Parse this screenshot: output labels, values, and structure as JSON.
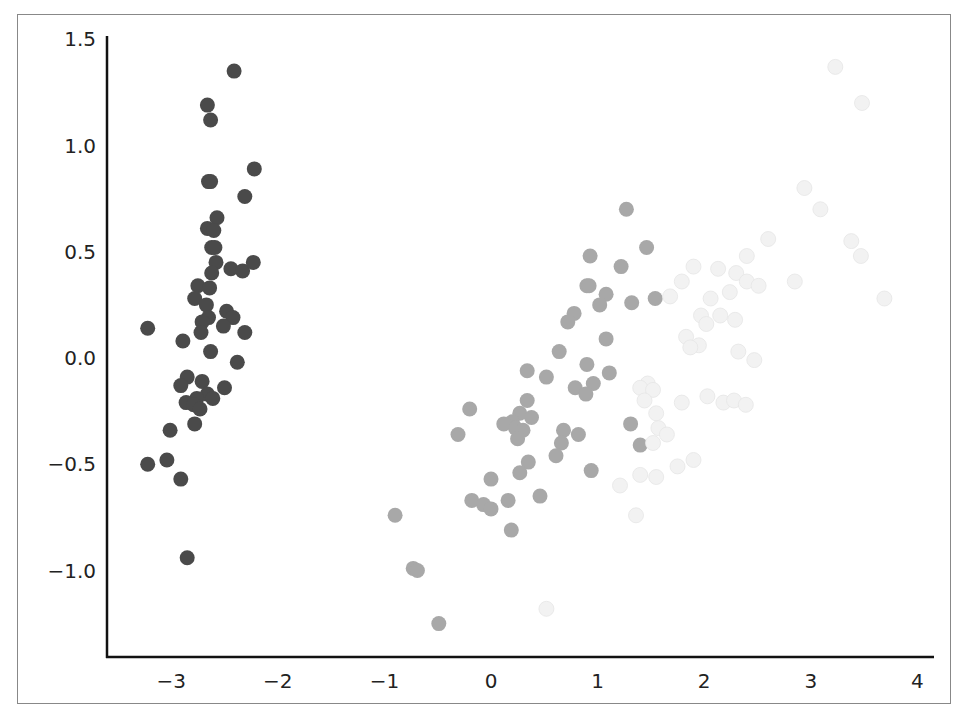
{
  "chart_data": {
    "type": "scatter",
    "title": "",
    "xlabel": "",
    "ylabel": "",
    "xlim": [
      -3.6,
      4.15
    ],
    "ylim": [
      -1.4,
      1.5
    ],
    "grid": false,
    "legend": null,
    "x_ticks": [
      "−3",
      "−2",
      "−1",
      "0",
      "1",
      "2",
      "3",
      "4"
    ],
    "x_tick_values": [
      -3,
      -2,
      -1,
      0,
      1,
      2,
      3,
      4
    ],
    "y_ticks": [
      "1.5",
      "1.0",
      "0.5",
      "0.0",
      "−0.5",
      "−1.0"
    ],
    "y_tick_values": [
      1.5,
      1.0,
      0.5,
      0.0,
      -0.5,
      -1.0
    ],
    "series": [
      {
        "name": "cluster-dark",
        "color": "#4a4a4a",
        "points": [
          [
            -2.41,
            1.35
          ],
          [
            -2.66,
            1.19
          ],
          [
            -2.63,
            1.12
          ],
          [
            -2.22,
            0.89
          ],
          [
            -2.31,
            0.76
          ],
          [
            -2.65,
            0.83
          ],
          [
            -2.63,
            0.83
          ],
          [
            -2.57,
            0.66
          ],
          [
            -2.66,
            0.61
          ],
          [
            -2.6,
            0.6
          ],
          [
            -2.62,
            0.52
          ],
          [
            -2.59,
            0.52
          ],
          [
            -2.58,
            0.45
          ],
          [
            -2.44,
            0.42
          ],
          [
            -2.33,
            0.41
          ],
          [
            -2.23,
            0.45
          ],
          [
            -2.62,
            0.4
          ],
          [
            -2.75,
            0.34
          ],
          [
            -2.64,
            0.33
          ],
          [
            -2.78,
            0.28
          ],
          [
            -2.67,
            0.25
          ],
          [
            -2.48,
            0.22
          ],
          [
            -2.42,
            0.19
          ],
          [
            -2.65,
            0.19
          ],
          [
            -2.71,
            0.17
          ],
          [
            -2.51,
            0.15
          ],
          [
            -2.31,
            0.12
          ],
          [
            -2.72,
            0.12
          ],
          [
            -3.22,
            0.14
          ],
          [
            -2.89,
            0.08
          ],
          [
            -2.63,
            0.03
          ],
          [
            -2.38,
            -0.02
          ],
          [
            -2.85,
            -0.09
          ],
          [
            -2.71,
            -0.11
          ],
          [
            -2.91,
            -0.13
          ],
          [
            -2.5,
            -0.14
          ],
          [
            -2.66,
            -0.17
          ],
          [
            -2.76,
            -0.19
          ],
          [
            -2.61,
            -0.19
          ],
          [
            -2.86,
            -0.21
          ],
          [
            -2.79,
            -0.22
          ],
          [
            -2.73,
            -0.24
          ],
          [
            -2.78,
            -0.31
          ],
          [
            -3.01,
            -0.34
          ],
          [
            -3.04,
            -0.48
          ],
          [
            -3.22,
            -0.5
          ],
          [
            -2.91,
            -0.57
          ],
          [
            -2.85,
            -0.94
          ]
        ]
      },
      {
        "name": "cluster-medium",
        "color": "#a8a8a8",
        "points": [
          [
            1.27,
            0.7
          ],
          [
            1.46,
            0.52
          ],
          [
            0.93,
            0.48
          ],
          [
            1.22,
            0.43
          ],
          [
            0.9,
            0.34
          ],
          [
            0.92,
            0.34
          ],
          [
            1.08,
            0.3
          ],
          [
            1.54,
            0.28
          ],
          [
            1.02,
            0.25
          ],
          [
            1.32,
            0.26
          ],
          [
            0.78,
            0.21
          ],
          [
            0.72,
            0.17
          ],
          [
            1.08,
            0.09
          ],
          [
            0.64,
            0.03
          ],
          [
            0.9,
            -0.03
          ],
          [
            0.34,
            -0.06
          ],
          [
            1.11,
            -0.07
          ],
          [
            0.52,
            -0.09
          ],
          [
            0.96,
            -0.12
          ],
          [
            0.79,
            -0.14
          ],
          [
            0.89,
            -0.17
          ],
          [
            0.34,
            -0.2
          ],
          [
            -0.2,
            -0.24
          ],
          [
            0.27,
            -0.26
          ],
          [
            0.38,
            -0.28
          ],
          [
            0.2,
            -0.3
          ],
          [
            0.12,
            -0.31
          ],
          [
            0.23,
            -0.33
          ],
          [
            0.3,
            -0.34
          ],
          [
            0.68,
            -0.34
          ],
          [
            0.82,
            -0.36
          ],
          [
            -0.31,
            -0.36
          ],
          [
            0.25,
            -0.38
          ],
          [
            1.31,
            -0.31
          ],
          [
            0.66,
            -0.4
          ],
          [
            1.4,
            -0.41
          ],
          [
            0.61,
            -0.46
          ],
          [
            0.35,
            -0.49
          ],
          [
            0.94,
            -0.53
          ],
          [
            0.27,
            -0.54
          ],
          [
            0.0,
            -0.57
          ],
          [
            -0.18,
            -0.67
          ],
          [
            0.46,
            -0.65
          ],
          [
            0.16,
            -0.67
          ],
          [
            -0.07,
            -0.69
          ],
          [
            0.0,
            -0.71
          ],
          [
            0.19,
            -0.81
          ],
          [
            -0.9,
            -0.74
          ],
          [
            -0.73,
            -0.99
          ],
          [
            -0.69,
            -1.0
          ],
          [
            -0.49,
            -1.25
          ]
        ]
      },
      {
        "name": "cluster-light",
        "color": "#f2f2f2",
        "points": [
          [
            3.23,
            1.37
          ],
          [
            3.48,
            1.2
          ],
          [
            2.94,
            0.8
          ],
          [
            3.09,
            0.7
          ],
          [
            3.38,
            0.55
          ],
          [
            3.47,
            0.48
          ],
          [
            2.6,
            0.56
          ],
          [
            2.4,
            0.48
          ],
          [
            2.13,
            0.42
          ],
          [
            1.9,
            0.43
          ],
          [
            2.3,
            0.4
          ],
          [
            2.4,
            0.36
          ],
          [
            2.51,
            0.34
          ],
          [
            1.79,
            0.36
          ],
          [
            2.85,
            0.36
          ],
          [
            2.24,
            0.31
          ],
          [
            1.68,
            0.29
          ],
          [
            2.06,
            0.28
          ],
          [
            3.69,
            0.28
          ],
          [
            1.97,
            0.2
          ],
          [
            2.15,
            0.2
          ],
          [
            2.29,
            0.18
          ],
          [
            2.02,
            0.16
          ],
          [
            1.83,
            0.1
          ],
          [
            1.95,
            0.06
          ],
          [
            1.87,
            0.05
          ],
          [
            2.47,
            -0.01
          ],
          [
            2.32,
            0.03
          ],
          [
            1.47,
            -0.12
          ],
          [
            1.4,
            -0.14
          ],
          [
            1.52,
            -0.15
          ],
          [
            1.44,
            -0.2
          ],
          [
            1.79,
            -0.21
          ],
          [
            2.03,
            -0.18
          ],
          [
            2.18,
            -0.21
          ],
          [
            2.28,
            -0.2
          ],
          [
            2.39,
            -0.22
          ],
          [
            1.55,
            -0.26
          ],
          [
            1.57,
            -0.33
          ],
          [
            1.52,
            -0.4
          ],
          [
            1.65,
            -0.36
          ],
          [
            1.9,
            -0.48
          ],
          [
            1.75,
            -0.51
          ],
          [
            1.4,
            -0.55
          ],
          [
            1.55,
            -0.56
          ],
          [
            1.21,
            -0.6
          ],
          [
            1.36,
            -0.74
          ],
          [
            0.52,
            -1.18
          ]
        ]
      }
    ]
  }
}
